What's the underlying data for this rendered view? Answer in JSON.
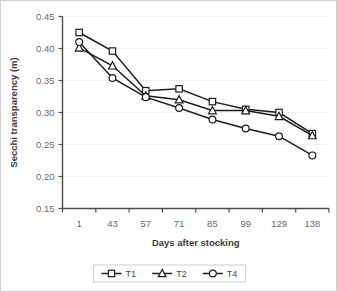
{
  "chart_data": {
    "type": "line",
    "title": "",
    "xlabel": "Days after stocking",
    "ylabel": "Secchi transparency (m)",
    "categories": [
      "1",
      "43",
      "57",
      "71",
      "85",
      "99",
      "129",
      "138"
    ],
    "ylim": [
      0.15,
      0.45
    ],
    "ytick_labels": [
      "0.15",
      "0.20",
      "0.25",
      "0.30",
      "0.35",
      "0.40",
      "0.45"
    ],
    "ytick_values": [
      0.15,
      0.2,
      0.25,
      0.3,
      0.35,
      0.4,
      0.45
    ],
    "grid": true,
    "legend_position": "bottom",
    "series": [
      {
        "name": "T1",
        "marker": "square",
        "values": [
          0.425,
          0.396,
          0.334,
          0.337,
          0.317,
          0.305,
          0.3,
          0.267
        ]
      },
      {
        "name": "T2",
        "marker": "triangle",
        "values": [
          0.401,
          0.373,
          0.326,
          0.32,
          0.303,
          0.303,
          0.294,
          0.264
        ]
      },
      {
        "name": "T4",
        "marker": "circle",
        "values": [
          0.41,
          0.354,
          0.324,
          0.307,
          0.289,
          0.275,
          0.263,
          0.233
        ]
      }
    ]
  },
  "legend": {
    "items": [
      {
        "label": "T1"
      },
      {
        "label": "T2"
      },
      {
        "label": "T4"
      }
    ]
  },
  "colors": {
    "line": "#1c1c1c",
    "marker_fill": "#ffffff",
    "axis": "#4a4a4a",
    "grid": "#f0f0f0",
    "tick_text": "#6b6b6b",
    "title_text": "#3b3b3b"
  }
}
